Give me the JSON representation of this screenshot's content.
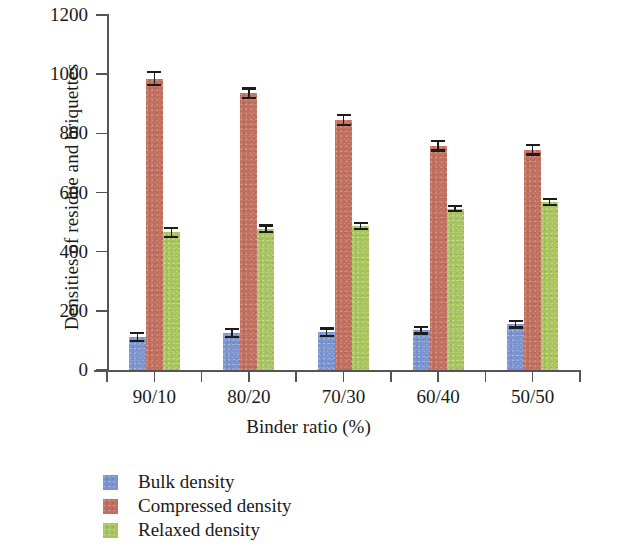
{
  "chart_data": {
    "type": "bar",
    "title": "",
    "xlabel": "Binder ratio (%)",
    "ylabel": "Densities of residue and briquettes",
    "categories": [
      "90/10",
      "80/20",
      "70/30",
      "60/40",
      "50/50"
    ],
    "ylim": [
      0,
      1200
    ],
    "yticks": [
      0,
      200,
      400,
      600,
      800,
      1000,
      1200
    ],
    "ytick_labels": [
      "0",
      "200",
      "400",
      "600",
      "800",
      "1000",
      "1200"
    ],
    "grid": false,
    "legend_position": "below-left",
    "series": [
      {
        "name": "Bulk density",
        "color": "#7b93cf",
        "values": [
          112,
          125,
          128,
          135,
          155
        ],
        "errors": [
          18,
          16,
          16,
          15,
          15
        ]
      },
      {
        "name": "Compressed density",
        "color": "#c1705f",
        "values": [
          985,
          935,
          845,
          758,
          745
        ],
        "errors": [
          25,
          20,
          20,
          20,
          20
        ]
      },
      {
        "name": "Relaxed density",
        "color": "#a8c45e",
        "values": [
          465,
          478,
          487,
          545,
          568
        ],
        "errors": [
          18,
          14,
          14,
          12,
          14
        ]
      }
    ]
  },
  "legend": {
    "items": [
      {
        "label": "Bulk density",
        "color": "#7b93cf",
        "swatch": "legend-swatch-blue"
      },
      {
        "label": "Compressed density",
        "color": "#c1705f",
        "swatch": "legend-swatch-red"
      },
      {
        "label": "Relaxed density",
        "color": "#a8c45e",
        "swatch": "legend-swatch-green"
      }
    ]
  }
}
